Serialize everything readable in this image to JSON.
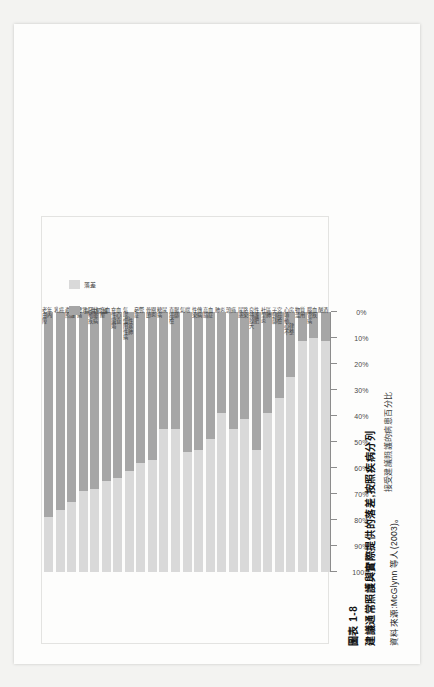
{
  "figure": {
    "number": "圖表 1-8",
    "title": "建議通常照護與實際提供的落差,按照疾病分列",
    "source": "資料來源:McGlynn 等人(2003)。"
  },
  "legend": {
    "position": "right",
    "items": [
      {
        "label": "提供照護",
        "color": "#a6a6a6"
      },
      {
        "label": "落差",
        "color": "#d9d9d9"
      }
    ]
  },
  "axis": {
    "y_title": "接受建議照護的病患百分比",
    "ticks": [
      "100%",
      "90%",
      "80%",
      "70%",
      "60%",
      "50%",
      "40%",
      "30%",
      "20%",
      "10%",
      "0%"
    ]
  },
  "chart_data": {
    "type": "bar",
    "title": "建議通常照護與實際提供的落差,按照疾病分列",
    "xlabel": "",
    "ylabel": "接受建議照護的病患百分比",
    "ylim": [
      0,
      100
    ],
    "grid": false,
    "stacked": true,
    "orientation": "vertical",
    "legend_position": "right",
    "categories": [
      "老年白內障",
      "乳癌",
      "產前照護",
      "腰背痛",
      "冠狀動脈疾病",
      "高血壓",
      "充血性心臟衰竭",
      "氣喘、慢性阻塞性肺病",
      "憂鬱症",
      "骨關節炎",
      "糖尿病",
      "直腸癌篩檢",
      "氣喘",
      "性傳染病",
      "高血脂症",
      "肺炎",
      "頭痛",
      "尿路感染",
      "良性攝護腺肥大",
      "社區型肺炎",
      "子宮頸癌篩檢",
      "心房顫動、心律不整",
      "物質濫用",
      "腦血管疾病",
      "酗酒"
    ],
    "series": [
      {
        "name": "提供照護",
        "color": "#a6a6a6",
        "values": [
          79,
          76,
          73,
          69,
          68,
          65,
          64,
          61,
          58,
          57,
          45,
          45,
          54,
          53,
          49,
          39,
          45,
          41,
          53,
          39,
          33,
          25,
          11,
          10,
          11
        ]
      },
      {
        "name": "落差",
        "color": "#d9d9d9",
        "values": [
          21,
          24,
          27,
          31,
          32,
          35,
          36,
          39,
          42,
          43,
          55,
          55,
          46,
          47,
          51,
          61,
          55,
          59,
          47,
          61,
          67,
          75,
          89,
          90,
          89
        ]
      }
    ]
  },
  "colors": {
    "care": "#a6a6a6",
    "gap": "#d9d9d9",
    "axis": "#8c8c8c",
    "text": "#3a3a3a",
    "paper": "#fdfdfc",
    "scan_background": "#f3f3f1"
  }
}
